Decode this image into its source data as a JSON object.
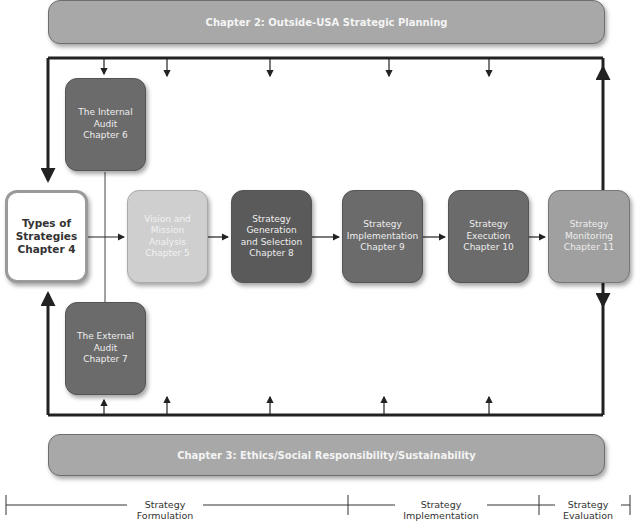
{
  "top_banner": {
    "label": "Chapter 2: Outside-USA Strategic Planning"
  },
  "bottom_banner": {
    "label": "Chapter 3:  Ethics/Social Responsibility/Sustainability"
  },
  "boxes": {
    "internal_audit": {
      "label": "The Internal\nAudit\nChapter 6"
    },
    "types_of_strategies": {
      "label": "Types of\nStrategies\nChapter 4"
    },
    "vision_mission": {
      "label": "Vision and\nMission\nAnalysis\nChapter 5"
    },
    "strategy_generation": {
      "label": "Strategy\nGeneration\nand Selection\nChapter 8"
    },
    "strategy_implementation": {
      "label": "Strategy\nImplementation\nChapter 9"
    },
    "strategy_execution": {
      "label": "Strategy\nExecution\nChapter 10"
    },
    "strategy_monitoring": {
      "label": "Strategy\nMonitoring\nChapter 11"
    },
    "external_audit": {
      "label": "The External\nAudit\nChapter 7"
    }
  },
  "timeline": {
    "formulation": "Strategy\nFormulation",
    "implementation": "Strategy\nImplementation",
    "evaluation": "Strategy\nEvaluation"
  },
  "colors": {
    "banner": "#a8a8a8",
    "dark_box": "#6b6b6b",
    "darker_box": "#5a5a5a",
    "light_box": "#cfcfcf",
    "mid_box": "#a0a0a0",
    "line": "#222222"
  }
}
